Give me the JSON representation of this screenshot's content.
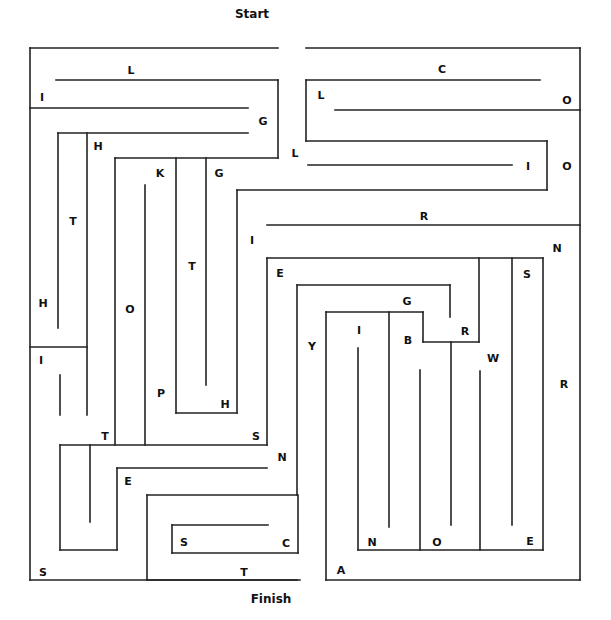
{
  "maze": {
    "start_label": "Start",
    "finish_label": "Finish",
    "start_pos": [
      252,
      14
    ],
    "finish_pos": [
      271,
      599
    ],
    "wall_color": "#222222",
    "walls": [
      [
        30,
        48,
        278,
        48
      ],
      [
        306,
        48,
        580,
        48
      ],
      [
        30,
        48,
        30,
        580
      ],
      [
        580,
        48,
        580,
        580
      ],
      [
        30,
        580,
        300,
        580
      ],
      [
        56,
        80,
        278,
        80
      ],
      [
        278,
        80,
        278,
        158
      ],
      [
        30,
        108,
        248,
        108
      ],
      [
        58,
        133,
        248,
        133
      ],
      [
        58,
        133,
        58,
        328
      ],
      [
        87,
        133,
        87,
        415
      ],
      [
        115,
        158,
        278,
        158
      ],
      [
        115,
        158,
        115,
        445
      ],
      [
        145,
        185,
        145,
        445
      ],
      [
        176,
        158,
        176,
        413
      ],
      [
        176,
        413,
        237,
        413
      ],
      [
        237,
        413,
        237,
        190
      ],
      [
        206,
        158,
        206,
        385
      ],
      [
        306,
        80,
        306,
        141
      ],
      [
        306,
        80,
        540,
        80
      ],
      [
        335,
        110,
        580,
        110
      ],
      [
        306,
        141,
        547,
        141
      ],
      [
        547,
        141,
        547,
        190
      ],
      [
        237,
        190,
        547,
        190
      ],
      [
        308,
        165,
        512,
        165
      ],
      [
        267,
        225,
        580,
        225
      ],
      [
        267,
        258,
        267,
        445
      ],
      [
        267,
        258,
        543,
        258
      ],
      [
        30,
        347,
        87,
        347
      ],
      [
        60,
        375,
        60,
        415
      ],
      [
        60,
        445,
        267,
        445
      ],
      [
        60,
        445,
        60,
        550
      ],
      [
        60,
        550,
        117,
        550
      ],
      [
        117,
        550,
        117,
        468
      ],
      [
        117,
        468,
        267,
        468
      ],
      [
        90,
        445,
        90,
        522
      ],
      [
        297,
        285,
        297,
        495
      ],
      [
        297,
        285,
        450,
        285
      ],
      [
        450,
        285,
        450,
        317
      ],
      [
        326,
        312,
        423,
        312
      ],
      [
        423,
        312,
        423,
        342
      ],
      [
        423,
        342,
        479,
        342
      ],
      [
        479,
        342,
        479,
        258
      ],
      [
        326,
        312,
        326,
        580
      ],
      [
        326,
        580,
        580,
        580
      ],
      [
        389,
        312,
        389,
        527
      ],
      [
        358,
        348,
        358,
        550
      ],
      [
        358,
        550,
        543,
        550
      ],
      [
        543,
        550,
        543,
        258
      ],
      [
        420,
        370,
        420,
        550
      ],
      [
        451,
        342,
        451,
        525
      ],
      [
        480,
        371,
        480,
        550
      ],
      [
        512,
        258,
        512,
        525
      ],
      [
        147,
        495,
        297,
        495
      ],
      [
        147,
        495,
        147,
        580
      ],
      [
        147,
        580,
        297,
        580
      ],
      [
        172,
        525,
        268,
        525
      ],
      [
        172,
        525,
        172,
        553
      ],
      [
        172,
        553,
        298,
        553
      ],
      [
        298,
        553,
        298,
        495
      ]
    ],
    "letters": [
      {
        "ch": "L",
        "x": 131,
        "y": 70
      },
      {
        "ch": "I",
        "x": 42,
        "y": 97
      },
      {
        "ch": "G",
        "x": 263,
        "y": 121
      },
      {
        "ch": "H",
        "x": 98,
        "y": 146
      },
      {
        "ch": "K",
        "x": 160,
        "y": 173
      },
      {
        "ch": "G",
        "x": 219,
        "y": 173
      },
      {
        "ch": "T",
        "x": 73,
        "y": 221
      },
      {
        "ch": "H",
        "x": 43,
        "y": 303
      },
      {
        "ch": "T",
        "x": 192,
        "y": 266
      },
      {
        "ch": "O",
        "x": 130,
        "y": 309
      },
      {
        "ch": "I",
        "x": 41,
        "y": 360
      },
      {
        "ch": "P",
        "x": 161,
        "y": 393
      },
      {
        "ch": "H",
        "x": 225,
        "y": 404
      },
      {
        "ch": "T",
        "x": 105,
        "y": 436
      },
      {
        "ch": "S",
        "x": 256,
        "y": 436
      },
      {
        "ch": "E",
        "x": 128,
        "y": 481
      },
      {
        "ch": "N",
        "x": 282,
        "y": 457
      },
      {
        "ch": "S",
        "x": 43,
        "y": 572
      },
      {
        "ch": "S",
        "x": 184,
        "y": 542
      },
      {
        "ch": "C",
        "x": 286,
        "y": 543
      },
      {
        "ch": "T",
        "x": 244,
        "y": 572
      },
      {
        "ch": "C",
        "x": 442,
        "y": 69
      },
      {
        "ch": "L",
        "x": 321,
        "y": 95
      },
      {
        "ch": "O",
        "x": 567,
        "y": 100
      },
      {
        "ch": "L",
        "x": 295,
        "y": 153
      },
      {
        "ch": "I",
        "x": 528,
        "y": 166
      },
      {
        "ch": "O",
        "x": 567,
        "y": 166
      },
      {
        "ch": "R",
        "x": 424,
        "y": 216
      },
      {
        "ch": "I",
        "x": 252,
        "y": 240
      },
      {
        "ch": "N",
        "x": 557,
        "y": 248
      },
      {
        "ch": "E",
        "x": 280,
        "y": 273
      },
      {
        "ch": "S",
        "x": 527,
        "y": 274
      },
      {
        "ch": "G",
        "x": 407,
        "y": 301
      },
      {
        "ch": "I",
        "x": 359,
        "y": 330
      },
      {
        "ch": "R",
        "x": 465,
        "y": 331
      },
      {
        "ch": "B",
        "x": 408,
        "y": 340
      },
      {
        "ch": "Y",
        "x": 312,
        "y": 346
      },
      {
        "ch": "W",
        "x": 493,
        "y": 358
      },
      {
        "ch": "R",
        "x": 564,
        "y": 384
      },
      {
        "ch": "N",
        "x": 372,
        "y": 542
      },
      {
        "ch": "O",
        "x": 437,
        "y": 542
      },
      {
        "ch": "E",
        "x": 530,
        "y": 541
      },
      {
        "ch": "A",
        "x": 341,
        "y": 570
      }
    ]
  }
}
